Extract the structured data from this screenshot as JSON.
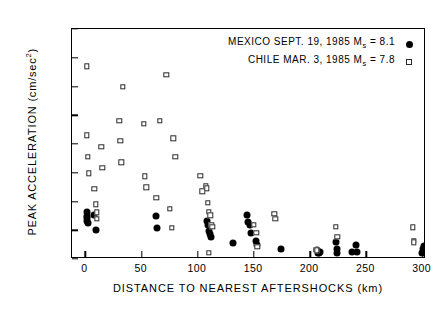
{
  "chart_data": {
    "type": "scatter",
    "title": "",
    "xlabel": "DISTANCE TO NEAREST AFTERSHOCKS (km)",
    "ylabel": "PEAK ACCELERATION (cm/sec2)",
    "ylabel_main": "PEAK ACCELERATION (cm/sec",
    "ylabel_sup": "2",
    "ylabel_end": ")",
    "xlim": [
      -12,
      303
    ],
    "ylim": [
      0,
      800
    ],
    "xticks": [
      0,
      50,
      100,
      150,
      200,
      250,
      300
    ],
    "xticklabels": [
      "0",
      "50",
      "100",
      "150",
      "200",
      "250",
      "300"
    ],
    "yticks": [
      0,
      100,
      200,
      300,
      400,
      500,
      600,
      700,
      800
    ],
    "yticklabels": [
      "0",
      "100",
      "200",
      "300",
      "400",
      "500",
      "600",
      "700",
      "800"
    ],
    "grid": false,
    "legend_position": "top-right-inside",
    "series": [
      {
        "name": "MEXICO SEPT. 19, 1985  Ms = 8.1",
        "event": "MEXICO",
        "date": "SEPT. 19, 1985",
        "magnitude_symbol": "M",
        "magnitude_sub": "s",
        "magnitude_value": "8.1",
        "marker": "filled-circle",
        "color": "#000000",
        "points": [
          [
            1,
            163
          ],
          [
            1,
            150
          ],
          [
            1,
            142
          ],
          [
            1,
            133
          ],
          [
            2,
            126
          ],
          [
            8,
            152
          ],
          [
            9,
            100
          ],
          [
            63,
            150
          ],
          [
            64,
            108
          ],
          [
            108,
            132
          ],
          [
            109,
            118
          ],
          [
            110,
            96
          ],
          [
            111,
            86
          ],
          [
            112,
            78
          ],
          [
            131,
            57
          ],
          [
            144,
            152
          ],
          [
            145,
            128
          ],
          [
            146,
            119
          ],
          [
            147,
            92
          ],
          [
            152,
            62
          ],
          [
            153,
            48
          ],
          [
            174,
            36
          ],
          [
            206,
            30
          ],
          [
            207,
            22
          ],
          [
            208,
            20
          ],
          [
            209,
            26
          ],
          [
            223,
            58
          ],
          [
            224,
            36
          ],
          [
            224,
            22
          ],
          [
            237,
            24
          ],
          [
            241,
            48
          ],
          [
            242,
            24
          ],
          [
            299,
            22
          ],
          [
            300,
            34
          ],
          [
            301,
            44
          ],
          [
            307,
            98
          ],
          [
            308,
            72
          ],
          [
            309,
            62
          ],
          [
            310,
            150
          ],
          [
            311,
            80
          ]
        ]
      },
      {
        "name": "CHILE MAR. 3, 1985  Ms = 7.8",
        "event": "CHILE",
        "date": "MAR. 3,  1985",
        "magnitude_symbol": "M",
        "magnitude_sub": "s",
        "magnitude_value": "7.8",
        "marker": "open-square",
        "color": "#2a2a2a",
        "points": [
          [
            1,
            670
          ],
          [
            1,
            430
          ],
          [
            2,
            355
          ],
          [
            3,
            298
          ],
          [
            8,
            245
          ],
          [
            9,
            190
          ],
          [
            10,
            163
          ],
          [
            10,
            140
          ],
          [
            14,
            390
          ],
          [
            15,
            318
          ],
          [
            30,
            480
          ],
          [
            31,
            412
          ],
          [
            32,
            337
          ],
          [
            33,
            600
          ],
          [
            52,
            470
          ],
          [
            53,
            288
          ],
          [
            54,
            250
          ],
          [
            63,
            212
          ],
          [
            66,
            480
          ],
          [
            72,
            640
          ],
          [
            75,
            175
          ],
          [
            77,
            108
          ],
          [
            78,
            420
          ],
          [
            80,
            355
          ],
          [
            102,
            290
          ],
          [
            104,
            235
          ],
          [
            107,
            253
          ],
          [
            108,
            246
          ],
          [
            109,
            196
          ],
          [
            110,
            165
          ],
          [
            111,
            152
          ],
          [
            112,
            118
          ],
          [
            113,
            112
          ],
          [
            110,
            22
          ],
          [
            150,
            120
          ],
          [
            152,
            92
          ],
          [
            153,
            42
          ],
          [
            168,
            158
          ],
          [
            169,
            140
          ],
          [
            205,
            33
          ],
          [
            206,
            30
          ],
          [
            223,
            112
          ],
          [
            224,
            78
          ],
          [
            291,
            110
          ],
          [
            292,
            64
          ],
          [
            292,
            58
          ]
        ]
      }
    ]
  }
}
